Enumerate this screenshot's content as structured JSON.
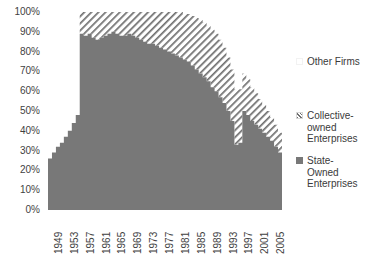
{
  "chart_data": {
    "type": "area",
    "subtype": "stacked-100-percent",
    "title": "",
    "subtitle": "",
    "xlabel": "",
    "ylabel": "",
    "ylim": [
      0,
      100
    ],
    "y_unit": "%",
    "grid": false,
    "legend_position": "right",
    "x": [
      1949,
      1950,
      1951,
      1952,
      1953,
      1954,
      1955,
      1956,
      1957,
      1958,
      1959,
      1960,
      1961,
      1962,
      1963,
      1964,
      1965,
      1966,
      1967,
      1968,
      1969,
      1970,
      1971,
      1972,
      1973,
      1974,
      1975,
      1976,
      1977,
      1978,
      1979,
      1980,
      1981,
      1982,
      1983,
      1984,
      1985,
      1986,
      1987,
      1988,
      1989,
      1990,
      1991,
      1992,
      1993,
      1994,
      1995,
      1996,
      1997,
      1998,
      1999,
      2000,
      2001,
      2002,
      2003,
      2004,
      2005,
      2006,
      2007
    ],
    "tick_labels_x": [
      "1949",
      "1953",
      "1957",
      "1961",
      "1965",
      "1969",
      "1973",
      "1977",
      "1981",
      "1985",
      "1989",
      "1993",
      "1997",
      "2001",
      "2005"
    ],
    "tick_labels_y": [
      "0%",
      "10%",
      "20%",
      "30%",
      "40%",
      "50%",
      "60%",
      "70%",
      "80%",
      "90%",
      "100%"
    ],
    "series": [
      {
        "name": "State-Owned Enterprises",
        "fill": "solid",
        "color": "#787878",
        "stack_order": 0,
        "values": [
          26,
          29,
          32,
          34,
          37,
          40,
          44,
          48,
          89,
          88,
          89,
          87,
          86,
          87,
          88,
          89,
          90,
          89,
          88,
          88,
          89,
          88,
          87,
          86,
          85,
          84,
          84,
          83,
          82,
          81,
          80,
          79,
          78,
          77,
          76,
          75,
          73,
          71,
          69,
          67,
          65,
          62,
          60,
          57,
          54,
          50,
          45,
          33,
          34,
          50,
          48,
          45,
          43,
          41,
          39,
          37,
          35,
          32,
          29
        ]
      },
      {
        "name": "Collective-owned Enterprises",
        "fill": "diagonal-hatch",
        "color": "#6f6f6f",
        "stack_order": 1,
        "values": [
          0,
          0,
          0,
          0,
          0,
          0,
          0,
          0,
          11,
          12,
          11,
          13,
          14,
          13,
          12,
          11,
          10,
          11,
          12,
          12,
          11,
          12,
          13,
          14,
          15,
          16,
          16,
          17,
          18,
          19,
          20,
          21,
          22,
          23,
          23,
          24,
          25,
          26,
          27,
          28,
          28,
          29,
          29,
          29,
          28,
          27,
          26,
          28,
          27,
          19,
          18,
          17,
          16,
          15,
          14,
          13,
          12,
          11,
          10
        ]
      },
      {
        "name": "Other Firms",
        "fill": "none",
        "color": "#ffffff",
        "stack_order": 2,
        "values": [
          74,
          71,
          68,
          66,
          63,
          60,
          56,
          52,
          0,
          0,
          0,
          0,
          0,
          0,
          0,
          0,
          0,
          0,
          0,
          0,
          0,
          0,
          0,
          0,
          0,
          0,
          0,
          0,
          0,
          0,
          0,
          0,
          0,
          0,
          1,
          1,
          2,
          3,
          4,
          5,
          7,
          9,
          11,
          14,
          18,
          23,
          29,
          39,
          39,
          31,
          34,
          38,
          41,
          44,
          47,
          50,
          53,
          57,
          61
        ]
      }
    ]
  },
  "legend": {
    "entries": [
      {
        "label": "Other Firms",
        "marker": "blank-square-icon"
      },
      {
        "label": "Collective-\nowned\nEnterprises",
        "marker": "hatched-square-icon"
      },
      {
        "label": "State-\nOwned\nEnterprises",
        "marker": "filled-square-icon"
      }
    ]
  }
}
